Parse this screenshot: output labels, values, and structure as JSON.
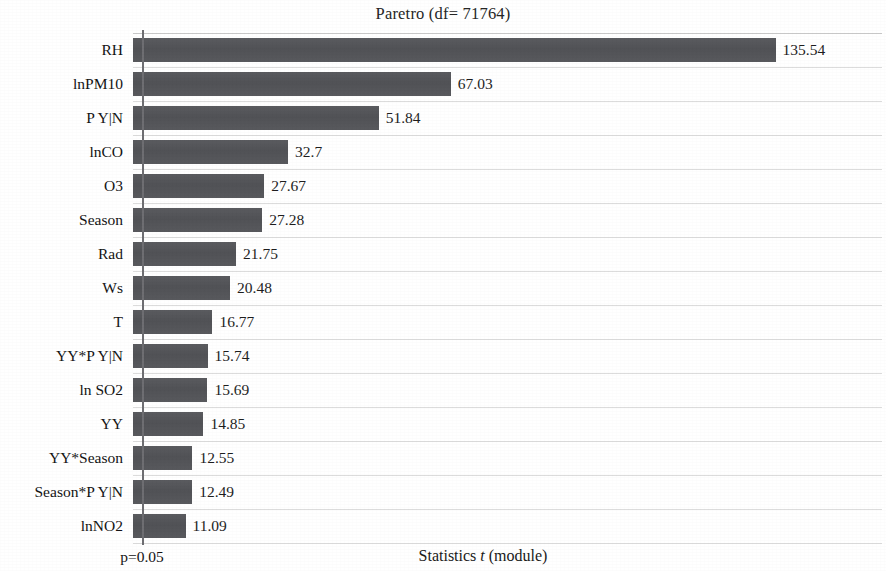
{
  "chart_data": {
    "type": "bar",
    "orientation": "horizontal",
    "title": "Paretro (df= 71764)",
    "xlabel": "Statistics t (module)",
    "xlabel_plain": "Statistics",
    "xlabel_italic": "t",
    "xlabel_tail": "(module)",
    "ylabel": "",
    "categories": [
      "RH",
      "lnPM10",
      "P Y|N",
      "lnCO",
      "O3",
      "Season",
      "Rad",
      "Ws",
      "T",
      "YY*P Y|N",
      "ln SO2",
      "YY",
      "YY*Season",
      "Season*P Y|N",
      "lnNO2"
    ],
    "values": [
      135.54,
      67.03,
      51.84,
      32.7,
      27.67,
      27.28,
      21.75,
      20.48,
      16.77,
      15.74,
      15.69,
      14.85,
      12.55,
      12.49,
      11.09
    ],
    "value_labels": [
      "135.54",
      "67.03",
      "51.84",
      "32.7",
      "27.67",
      "27.28",
      "21.75",
      "20.48",
      "16.77",
      "15.74",
      "15.69",
      "14.85",
      "12.55",
      "12.49",
      "11.09"
    ],
    "xlim": [
      0,
      158
    ],
    "grid": true,
    "legend": false,
    "reference_line": {
      "label": "p=0.05",
      "value": 1.96,
      "color": "#6e6e72"
    },
    "bar_color": "#55565a",
    "background_color": "#ffffff"
  },
  "footer": {
    "p_label": "p=0.05",
    "x_axis_title": "Statistics t (module)"
  }
}
